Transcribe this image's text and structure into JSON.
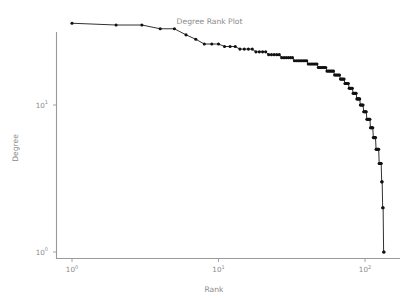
{
  "chart_data": {
    "type": "line",
    "title": "Degree Rank Plot",
    "xlabel": "Rank",
    "ylabel": "Degree",
    "xscale": "log",
    "yscale": "log",
    "grid": false,
    "legend": null,
    "marker": "point",
    "marker_color": "#111111",
    "line_color": "#1a1a1a",
    "xlim": [
      0.85,
      160
    ],
    "ylim": [
      0.85,
      46
    ],
    "xticks": [
      1,
      10,
      100
    ],
    "xtick_labels": [
      "10⁰",
      "10¹",
      "10²"
    ],
    "xtick_bases": [
      "10",
      "10",
      "10"
    ],
    "xtick_exps": [
      "0",
      "1",
      "2"
    ],
    "yticks": [
      1,
      10
    ],
    "ytick_labels": [
      "10⁰",
      "10¹"
    ],
    "ytick_bases": [
      "10",
      "10"
    ],
    "ytick_exps": [
      "0",
      "1"
    ],
    "x": [
      1,
      2,
      3,
      4,
      5,
      6,
      7,
      8,
      9,
      10,
      11,
      12,
      13,
      14,
      15,
      16,
      17,
      18,
      19,
      20,
      21,
      22,
      23,
      24,
      25,
      26,
      27,
      28,
      29,
      30,
      31,
      32,
      33,
      34,
      35,
      36,
      37,
      38,
      39,
      40,
      41,
      42,
      43,
      44,
      45,
      46,
      47,
      48,
      49,
      50,
      51,
      52,
      53,
      54,
      55,
      56,
      57,
      58,
      59,
      60,
      61,
      62,
      63,
      64,
      65,
      66,
      67,
      68,
      69,
      70,
      71,
      72,
      73,
      74,
      75,
      76,
      77,
      78,
      79,
      80,
      81,
      82,
      83,
      84,
      85,
      86,
      87,
      88,
      89,
      90,
      91,
      92,
      93,
      94,
      95,
      96,
      97,
      98,
      99,
      100,
      101,
      102,
      103,
      104,
      105,
      106,
      107,
      108,
      109,
      110,
      111,
      112,
      113,
      114,
      115,
      116,
      117,
      118,
      119,
      120,
      121,
      122,
      123,
      124,
      125,
      126,
      127,
      128,
      129,
      130,
      131,
      132,
      133,
      134,
      135
    ],
    "y": [
      36,
      35,
      35,
      33,
      33,
      30,
      28,
      26,
      26,
      26,
      25,
      25,
      25,
      24,
      24,
      24,
      24,
      23,
      23,
      23,
      23,
      22,
      22,
      22,
      22,
      22,
      21,
      21,
      21,
      21,
      21,
      21,
      20,
      20,
      20,
      20,
      20,
      20,
      20,
      20,
      19,
      19,
      19,
      19,
      19,
      19,
      19,
      18,
      18,
      18,
      18,
      18,
      18,
      18,
      17,
      17,
      17,
      17,
      17,
      17,
      17,
      16,
      16,
      16,
      16,
      16,
      16,
      15,
      15,
      15,
      15,
      15,
      14,
      14,
      14,
      14,
      14,
      13,
      13,
      13,
      13,
      13,
      12,
      12,
      12,
      12,
      12,
      11,
      11,
      11,
      11,
      11,
      10,
      10,
      10,
      10,
      10,
      9,
      9,
      9,
      9,
      9,
      8,
      8,
      8,
      8,
      8,
      8,
      7,
      7,
      7,
      7,
      7,
      6,
      6,
      6,
      6,
      6,
      5,
      5,
      5,
      5,
      5,
      5,
      4,
      4,
      4,
      4,
      4,
      3,
      3,
      2,
      2,
      1,
      1
    ],
    "x_label_series": "Rank",
    "y_label_series": "Degree",
    "n_points": 135,
    "max_degree": 36,
    "min_degree": 1
  }
}
